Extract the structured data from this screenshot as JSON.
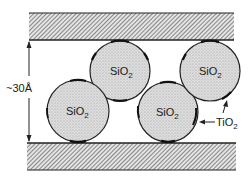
{
  "diagram": {
    "type": "schematic",
    "gap_label": "~30Å",
    "particles": [
      {
        "label": "SiO",
        "sub": "2",
        "cx": 120,
        "cy": 71,
        "r": 30
      },
      {
        "label": "SiO",
        "sub": "2",
        "cx": 78,
        "cy": 111,
        "r": 31
      },
      {
        "label": "SiO",
        "sub": "2",
        "cx": 168,
        "cy": 112,
        "r": 30
      },
      {
        "label": "SiO",
        "sub": "2",
        "cx": 210,
        "cy": 71,
        "r": 30
      }
    ],
    "coating_label": {
      "text": "TiO",
      "sub": "2"
    },
    "plates": [
      {
        "name": "top-plate",
        "x": 29,
        "y": 13,
        "w": 205,
        "h": 27
      },
      {
        "name": "bottom-plate",
        "x": 27,
        "y": 143,
        "w": 209,
        "h": 27
      }
    ],
    "colors": {
      "ink": "#1a1a1a",
      "particle_fill": "#d6d6d6",
      "hatch": "#555555",
      "background": "#ffffff"
    }
  }
}
